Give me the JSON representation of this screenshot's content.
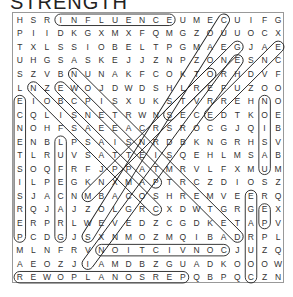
{
  "puzzle": {
    "title": "STRENGTH",
    "rows": [
      "HSRINFLUENCEUMECUIFG",
      "PIIDKGXMXFQMGZOUUOCX",
      "TXLSSIOBELTPGMAEGJAE",
      "UHGSASKEJJZNPZONESNC",
      "SZVBNUNAKFCOKTORHDVF",
      "LNZEWOJDWDSHLREFUZOO",
      "EIOBCPISXUKSTVRREHNO",
      "CQLISNETRWNSECEDTKOE",
      "NOHFSAEEACRSROCGJQIB",
      "ENBLPSAISNRDBKNGRHSV",
      "TLRUVSATTEISQEHLMSAB",
      "SOQFRFJPPATMRVLFXMUM",
      "ILPEGKNXMAPTRCZDIOSZ",
      "SJACNMBACOSHREMVEERQ",
      "RQJAJZOLGRCXDWTGRGEX",
      "ERPRLWEVEDZCGDKETAPV",
      "PCDGJSXNMOZMQIBADRPL",
      "MLNFRVNOITCIVNOCJUZQ",
      "AEOZJIAMDBZGUADKOOOW",
      "REWOPLANOSREPQBPQCZN"
    ],
    "found_words": [
      {
        "word": "INFLUENCE",
        "start": [
          0,
          3
        ],
        "end": [
          0,
          11
        ]
      },
      {
        "word": "CONVICTION",
        "start": [
          17,
          15
        ],
        "end": [
          17,
          6
        ]
      },
      {
        "word": "PERSONALPOWER",
        "start": [
          19,
          12
        ],
        "end": [
          19,
          0
        ]
      },
      {
        "word": "PERSISTENCE",
        "start": [
          16,
          0
        ],
        "end": [
          6,
          0
        ]
      },
      {
        "word": "GRACEFUL",
        "start": [
          16,
          3
        ],
        "end": [
          9,
          3
        ]
      },
      {
        "word": "NOISUM",
        "start": [
          6,
          18
        ],
        "end": [
          11,
          18
        ]
      },
      {
        "word": "COURAGE",
        "start": [
          19,
          17
        ],
        "end": [
          13,
          17
        ]
      },
      {
        "word": "EP",
        "start": [
          14,
          18
        ],
        "end": [
          15,
          18
        ]
      }
    ],
    "diagonals": [
      {
        "start": [
          0,
          15
        ],
        "end": [
          16,
          5
        ]
      },
      {
        "start": [
          2,
          19
        ],
        "end": [
          7,
          14
        ]
      },
      {
        "start": [
          2,
          16
        ],
        "end": [
          13,
          5
        ]
      },
      {
        "start": [
          3,
          16
        ],
        "end": [
          18,
          5
        ]
      },
      {
        "start": [
          4,
          4
        ],
        "end": [
          16,
          16
        ]
      },
      {
        "start": [
          5,
          1
        ],
        "end": [
          14,
          10
        ]
      },
      {
        "start": [
          5,
          3
        ],
        "end": [
          12,
          10
        ]
      },
      {
        "start": [
          7,
          11
        ],
        "end": [
          4,
          14
        ]
      }
    ]
  }
}
